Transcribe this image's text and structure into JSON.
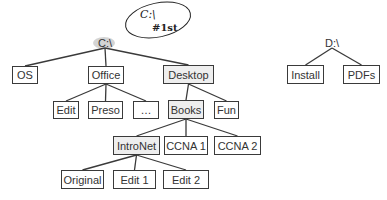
{
  "diagram": {
    "type": "directory-tree",
    "trees": [
      {
        "root": {
          "id": "c",
          "label": "C:\\",
          "x": 105,
          "y": 43
        },
        "nodes": [
          {
            "id": "os",
            "label": "OS",
            "x": 12,
            "y": 66,
            "w": 26,
            "h": 18,
            "parent": "c",
            "shaded": false
          },
          {
            "id": "office",
            "label": "Office",
            "x": 88,
            "y": 66,
            "w": 36,
            "h": 18,
            "parent": "c",
            "shaded": false
          },
          {
            "id": "desktop",
            "label": "Desktop",
            "x": 163,
            "y": 65,
            "w": 51,
            "h": 19,
            "parent": "c",
            "shaded": true
          },
          {
            "id": "edit",
            "label": "Edit",
            "x": 53,
            "y": 101,
            "w": 26,
            "h": 18,
            "parent": "office",
            "shaded": false
          },
          {
            "id": "preso",
            "label": "Preso",
            "x": 88,
            "y": 101,
            "w": 35,
            "h": 18,
            "parent": "office",
            "shaded": false
          },
          {
            "id": "ellipsis",
            "label": "…",
            "x": 133,
            "y": 101,
            "w": 26,
            "h": 18,
            "parent": "office",
            "shaded": false
          },
          {
            "id": "books",
            "label": "Books",
            "x": 168,
            "y": 100,
            "w": 36,
            "h": 19,
            "parent": "desktop",
            "shaded": true
          },
          {
            "id": "fun",
            "label": "Fun",
            "x": 214,
            "y": 101,
            "w": 25,
            "h": 18,
            "parent": "desktop",
            "shaded": false
          },
          {
            "id": "intronet",
            "label": "IntroNet",
            "x": 113,
            "y": 136,
            "w": 47,
            "h": 19,
            "parent": "books",
            "shaded": true
          },
          {
            "id": "ccna1",
            "label": "CCNA 1",
            "x": 164,
            "y": 136,
            "w": 44,
            "h": 19,
            "parent": "books",
            "shaded": false
          },
          {
            "id": "ccna2",
            "label": "CCNA 2",
            "x": 214,
            "y": 136,
            "w": 47,
            "h": 19,
            "parent": "books",
            "shaded": false
          },
          {
            "id": "original",
            "label": "Original",
            "x": 61,
            "y": 170,
            "w": 43,
            "h": 19,
            "parent": "intronet",
            "shaded": false
          },
          {
            "id": "edit1",
            "label": "Edit 1",
            "x": 113,
            "y": 170,
            "w": 43,
            "h": 19,
            "parent": "intronet",
            "shaded": false
          },
          {
            "id": "edit2",
            "label": "Edit 2",
            "x": 163,
            "y": 170,
            "w": 46,
            "h": 19,
            "parent": "intronet",
            "shaded": false
          }
        ]
      },
      {
        "root": {
          "id": "d",
          "label": "D:\\",
          "x": 332,
          "y": 43
        },
        "nodes": [
          {
            "id": "install",
            "label": "Install",
            "x": 287,
            "y": 65,
            "w": 37,
            "h": 19,
            "parent": "d",
            "shaded": false
          },
          {
            "id": "pdfs",
            "label": "PDFs",
            "x": 343,
            "y": 65,
            "w": 37,
            "h": 19,
            "parent": "d",
            "shaded": false
          }
        ]
      }
    ],
    "annotation": {
      "text_line1": "C:\\",
      "text_line2": "#1st",
      "ellipse": {
        "cx": 158,
        "cy": 20,
        "rx": 33,
        "ry": 17
      }
    },
    "highlight": {
      "cx": 104,
      "cy": 43,
      "rx": 11,
      "ry": 6,
      "color": "#b8b8b8"
    },
    "colors": {
      "line": "#3a3a3a",
      "text": "#333333",
      "ink": "#222222"
    }
  }
}
